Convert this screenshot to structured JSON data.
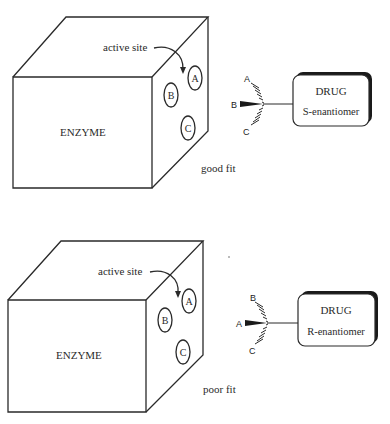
{
  "diagram": {
    "panels": [
      {
        "id": "s",
        "enzyme_label": "ENZYME",
        "active_site_label": "active site",
        "site_labels": [
          "A",
          "B",
          "C"
        ],
        "drug_title": "DRUG",
        "drug_subtitle": "S-enantiomer",
        "substituents": {
          "up": "A",
          "wedge": "B",
          "down": "C"
        },
        "fit_label": "good fit"
      },
      {
        "id": "r",
        "enzyme_label": "ENZYME",
        "active_site_label": "active site",
        "site_labels": [
          "A",
          "B",
          "C"
        ],
        "drug_title": "DRUG",
        "drug_subtitle": "R-enantiomer",
        "substituents": {
          "up": "B",
          "wedge": "A",
          "down": "C"
        },
        "fit_label": "poor fit"
      }
    ]
  }
}
